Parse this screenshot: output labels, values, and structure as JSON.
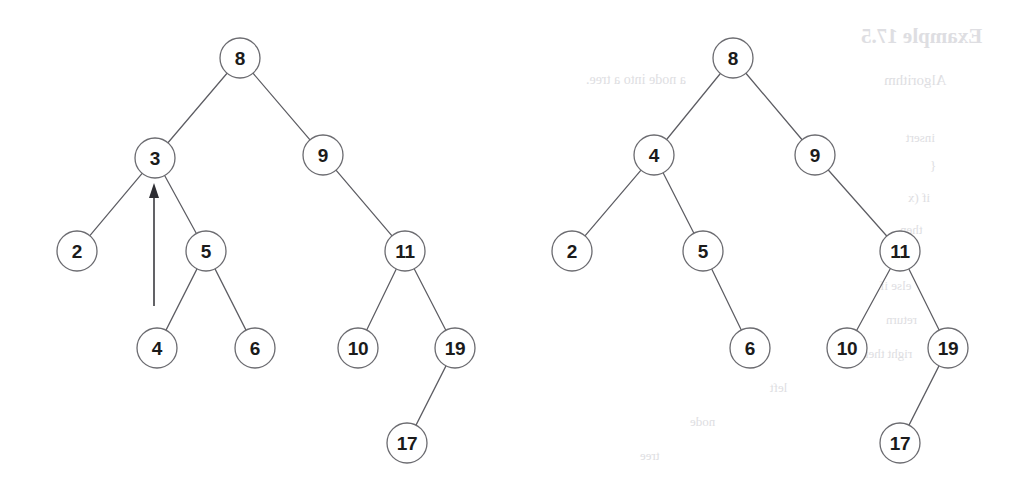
{
  "figure": {
    "background_color": "#ffffff",
    "node_stroke_color": "#6b6b70",
    "edge_stroke_color": "#5d5d63",
    "label_color": "#1b1b1b",
    "arrow_color": "#2e2e33",
    "node_radius": 20
  },
  "trees": [
    {
      "id": "left-tree",
      "caption": "before-insertion",
      "nodes": [
        {
          "key": "L8",
          "label": "8",
          "x": 240,
          "y": 58,
          "depth": 0
        },
        {
          "key": "L3",
          "label": "3",
          "x": 155,
          "y": 158,
          "depth": 1
        },
        {
          "key": "L9",
          "label": "9",
          "x": 323,
          "y": 155,
          "depth": 1
        },
        {
          "key": "L2",
          "label": "2",
          "x": 77,
          "y": 251,
          "depth": 2
        },
        {
          "key": "L5",
          "label": "5",
          "x": 206,
          "y": 251,
          "depth": 2
        },
        {
          "key": "L11",
          "label": "11",
          "x": 405,
          "y": 251,
          "depth": 2
        },
        {
          "key": "L4",
          "label": "4",
          "x": 157,
          "y": 348,
          "depth": 3
        },
        {
          "key": "L6",
          "label": "6",
          "x": 255,
          "y": 348,
          "depth": 3
        },
        {
          "key": "L10",
          "label": "10",
          "x": 358,
          "y": 348,
          "depth": 3
        },
        {
          "key": "L19",
          "label": "19",
          "x": 455,
          "y": 348,
          "depth": 3
        },
        {
          "key": "L17",
          "label": "17",
          "x": 407,
          "y": 443,
          "depth": 4
        }
      ],
      "edges": [
        {
          "from": "L8",
          "to": "L3",
          "side": "left"
        },
        {
          "from": "L8",
          "to": "L9",
          "side": "right"
        },
        {
          "from": "L3",
          "to": "L2",
          "side": "left"
        },
        {
          "from": "L3",
          "to": "L5",
          "side": "right"
        },
        {
          "from": "L9",
          "to": "L11",
          "side": "right"
        },
        {
          "from": "L5",
          "to": "L4",
          "side": "left"
        },
        {
          "from": "L5",
          "to": "L6",
          "side": "right"
        },
        {
          "from": "L11",
          "to": "L10",
          "side": "left"
        },
        {
          "from": "L11",
          "to": "L19",
          "side": "right"
        },
        {
          "from": "L19",
          "to": "L17",
          "side": "left"
        }
      ],
      "annotation": {
        "type": "insertion-arrow",
        "target_node": "L3",
        "tail_x": 154,
        "tail_y": 306,
        "tip_x": 154,
        "tip_y": 183,
        "head_width": 10,
        "head_height": 15
      }
    },
    {
      "id": "right-tree",
      "caption": "after-insertion",
      "nodes": [
        {
          "key": "R8",
          "label": "8",
          "x": 733,
          "y": 58,
          "depth": 0
        },
        {
          "key": "R4",
          "label": "4",
          "x": 654,
          "y": 155,
          "depth": 1
        },
        {
          "key": "R9",
          "label": "9",
          "x": 815,
          "y": 155,
          "depth": 1
        },
        {
          "key": "R2",
          "label": "2",
          "x": 572,
          "y": 251,
          "depth": 2
        },
        {
          "key": "R5",
          "label": "5",
          "x": 703,
          "y": 251,
          "depth": 2
        },
        {
          "key": "R11",
          "label": "11",
          "x": 900,
          "y": 251,
          "depth": 2
        },
        {
          "key": "R6",
          "label": "6",
          "x": 750,
          "y": 348,
          "depth": 3
        },
        {
          "key": "R10",
          "label": "10",
          "x": 847,
          "y": 348,
          "depth": 3
        },
        {
          "key": "R19",
          "label": "19",
          "x": 948,
          "y": 348,
          "depth": 3
        },
        {
          "key": "R17",
          "label": "17",
          "x": 900,
          "y": 443,
          "depth": 4
        }
      ],
      "edges": [
        {
          "from": "R8",
          "to": "R4",
          "side": "left"
        },
        {
          "from": "R8",
          "to": "R9",
          "side": "right"
        },
        {
          "from": "R4",
          "to": "R2",
          "side": "left"
        },
        {
          "from": "R4",
          "to": "R5",
          "side": "right"
        },
        {
          "from": "R9",
          "to": "R11",
          "side": "right"
        },
        {
          "from": "R5",
          "to": "R6",
          "side": "right"
        },
        {
          "from": "R11",
          "to": "R10",
          "side": "left"
        },
        {
          "from": "R11",
          "to": "R19",
          "side": "right"
        },
        {
          "from": "R19",
          "to": "R17",
          "side": "left"
        }
      ],
      "annotation": null
    }
  ],
  "ghost_bleedthrough": [
    {
      "text": "Example 17.5",
      "x": 861,
      "y": 24,
      "size": 21,
      "weight": "700"
    },
    {
      "text": "Algorithm",
      "x": 884,
      "y": 72,
      "size": 15,
      "weight": "400"
    },
    {
      "text": "a node into a tree.",
      "x": 586,
      "y": 72,
      "size": 14,
      "weight": "400"
    },
    {
      "text": "insert",
      "x": 906,
      "y": 130,
      "size": 13,
      "weight": "400"
    },
    {
      "text": "{",
      "x": 930,
      "y": 158,
      "size": 13,
      "weight": "400"
    },
    {
      "text": "if (x",
      "x": 908,
      "y": 190,
      "size": 13,
      "weight": "400"
    },
    {
      "text": "then",
      "x": 900,
      "y": 222,
      "size": 13,
      "weight": "400"
    },
    {
      "text": "else if",
      "x": 880,
      "y": 278,
      "size": 13,
      "weight": "400"
    },
    {
      "text": "return",
      "x": 886,
      "y": 312,
      "size": 13,
      "weight": "400"
    },
    {
      "text": "right then",
      "x": 862,
      "y": 346,
      "size": 13,
      "weight": "400"
    },
    {
      "text": "left",
      "x": 770,
      "y": 380,
      "size": 13,
      "weight": "400"
    },
    {
      "text": "node",
      "x": 690,
      "y": 414,
      "size": 13,
      "weight": "400"
    },
    {
      "text": "tree",
      "x": 640,
      "y": 448,
      "size": 13,
      "weight": "400"
    }
  ]
}
